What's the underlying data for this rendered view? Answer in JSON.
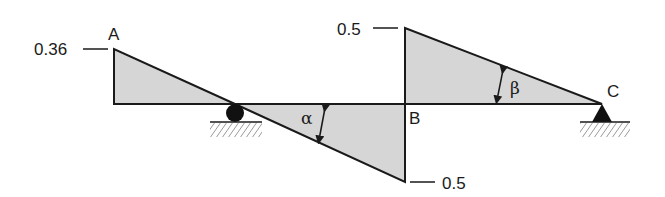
{
  "diagram": {
    "type": "influence-line",
    "points": {
      "A": {
        "label": "A",
        "value_label": "0.36"
      },
      "B": {
        "label": "B",
        "value_top_label": "0.5",
        "value_bottom_label": "0.5"
      },
      "C": {
        "label": "C"
      }
    },
    "angles": {
      "alpha": "α",
      "beta": "β"
    },
    "supports": [
      {
        "type": "roller",
        "position": "between A and B"
      },
      {
        "type": "pin",
        "position": "C"
      }
    ],
    "colors": {
      "fill": "#d6d6d6",
      "stroke": "#1a1a1a",
      "background": "#ffffff"
    }
  }
}
